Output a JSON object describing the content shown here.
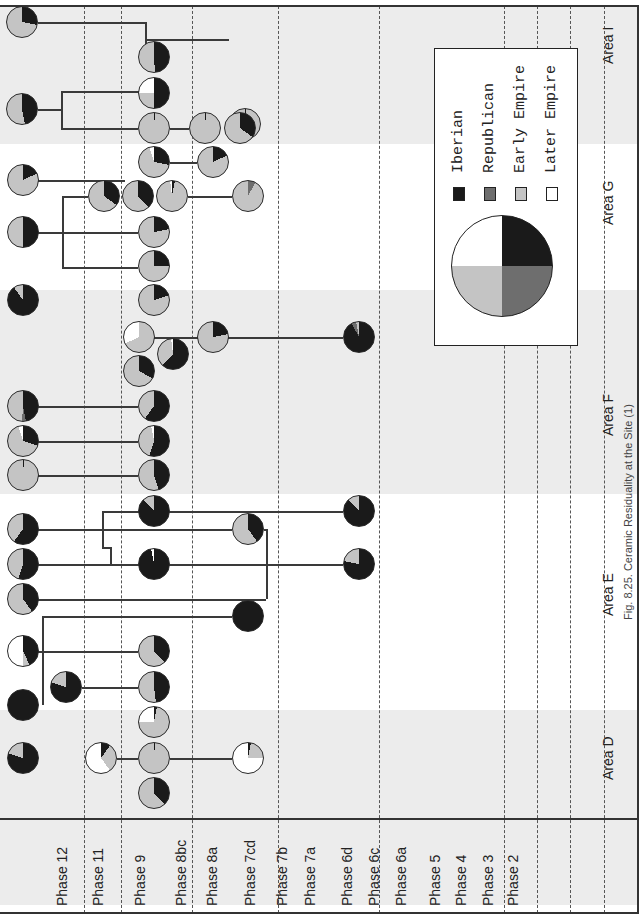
{
  "figure": {
    "caption": "Fig. 8.25. Ceramic Residuality at the Site (1)",
    "orientation": "rotated-90-ccw"
  },
  "colors": {
    "iberian": "#1a1a1a",
    "republican": "#6e6e6e",
    "early_empire": "#c4c4c4",
    "later_empire": "#ffffff",
    "band": "#ececec"
  },
  "legend": {
    "items": [
      {
        "label": "Iberian",
        "color": "#1a1a1a"
      },
      {
        "label": "Republican",
        "color": "#6e6e6e"
      },
      {
        "label": "Early Empire",
        "color": "#c4c4c4"
      },
      {
        "label": "Later Empire",
        "color": "#ffffff"
      }
    ]
  },
  "phases": [
    "Phase 12",
    "Phase 11",
    "Phase 9",
    "Phase 8bc",
    "Phase 8a",
    "Phase 7cd",
    "Phase 7b",
    "Phase 7a",
    "Phase 6d",
    "Phase 6c",
    "Phase 6a",
    "Phase 5",
    "Phase 4",
    "Phase 3",
    "Phase 2"
  ],
  "areas": [
    "Area D",
    "Area E",
    "Area F",
    "Area G",
    "Area I"
  ],
  "chart_data": {
    "type": "pie",
    "title": "Ceramic Residuality at the Site (1)",
    "xlabel": "Phase",
    "ylabel": "Area",
    "legend": [
      "Iberian",
      "Republican",
      "Early Empire",
      "Later Empire"
    ],
    "phase_axis": [
      "Phase 12",
      "Phase 11",
      "Phase 9",
      "Phase 8bc",
      "Phase 8a",
      "Phase 7cd",
      "Phase 7b",
      "Phase 7a",
      "Phase 6d",
      "Phase 6c",
      "Phase 6a",
      "Phase 5",
      "Phase 4",
      "Phase 3",
      "Phase 2"
    ],
    "area_axis": [
      "Area D",
      "Area E",
      "Area F",
      "Area G",
      "Area I"
    ],
    "pies": [
      {
        "area": "Area I",
        "phase": "Phase 12",
        "x": 22,
        "y": 22,
        "r": 16,
        "slices": [
          28,
          0,
          72,
          0
        ]
      },
      {
        "area": "Area I",
        "phase": "Phase 8bc",
        "x": 245,
        "y": 124,
        "r": 16,
        "slices": [
          1,
          0,
          99,
          0
        ]
      },
      {
        "area": "Area I",
        "phase": "Phase 9",
        "x": 154,
        "y": 57,
        "r": 16,
        "slices": [
          49,
          0,
          51,
          0
        ]
      },
      {
        "area": "Area I",
        "phase": "Phase 12",
        "x": 22,
        "y": 109,
        "r": 16,
        "slices": [
          47,
          0,
          53,
          0
        ]
      },
      {
        "area": "Area I",
        "phase": "Phase 9",
        "x": 154,
        "y": 93,
        "r": 16,
        "slices": [
          50,
          0,
          25,
          25
        ]
      },
      {
        "area": "Area I",
        "phase": "Phase 9",
        "x": 154,
        "y": 128,
        "r": 16,
        "slices": [
          1,
          0,
          99,
          0
        ]
      },
      {
        "area": "Area I",
        "phase": "Phase 8bc",
        "x": 205,
        "y": 128,
        "r": 16,
        "slices": [
          1,
          0,
          99,
          0
        ]
      },
      {
        "area": "Area I",
        "phase": "Phase 8bc",
        "x": 240,
        "y": 128,
        "r": 16,
        "slices": [
          35,
          0,
          65,
          0
        ]
      },
      {
        "area": "Area G",
        "phase": "Phase 9",
        "x": 154,
        "y": 162,
        "r": 16,
        "slices": [
          28,
          0,
          67,
          5
        ]
      },
      {
        "area": "Area G",
        "phase": "Phase 8bc",
        "x": 213,
        "y": 162,
        "r": 16,
        "slices": [
          18,
          0,
          82,
          0
        ]
      },
      {
        "area": "Area G",
        "phase": "Phase 12",
        "x": 23,
        "y": 180,
        "r": 16,
        "slices": [
          18,
          0,
          82,
          0
        ]
      },
      {
        "area": "Area G",
        "phase": "Phase 11",
        "x": 104,
        "y": 196,
        "r": 16,
        "slices": [
          35,
          0,
          65,
          0
        ]
      },
      {
        "area": "Area G",
        "phase": "Phase 9",
        "x": 138,
        "y": 196,
        "r": 16,
        "slices": [
          38,
          0,
          62,
          0
        ]
      },
      {
        "area": "Area G",
        "phase": "Phase 9",
        "x": 172,
        "y": 196,
        "r": 16,
        "slices": [
          3,
          0,
          95,
          2
        ]
      },
      {
        "area": "Area G",
        "phase": "Phase 8a",
        "x": 248,
        "y": 196,
        "r": 16,
        "slices": [
          0,
          8,
          92,
          0
        ]
      },
      {
        "area": "Area G",
        "phase": "Phase 12",
        "x": 23,
        "y": 232,
        "r": 16,
        "slices": [
          50,
          0,
          50,
          0
        ]
      },
      {
        "area": "Area G",
        "phase": "Phase 9",
        "x": 154,
        "y": 232,
        "r": 16,
        "slices": [
          22,
          0,
          78,
          0
        ]
      },
      {
        "area": "Area G",
        "phase": "Phase 9",
        "x": 154,
        "y": 266,
        "r": 16,
        "slices": [
          25,
          0,
          75,
          0
        ]
      },
      {
        "area": "Area F",
        "phase": "Phase 12",
        "x": 23,
        "y": 300,
        "r": 16,
        "slices": [
          90,
          0,
          10,
          0
        ]
      },
      {
        "area": "Area F",
        "phase": "Phase 9",
        "x": 154,
        "y": 300,
        "r": 16,
        "slices": [
          20,
          0,
          80,
          0
        ]
      },
      {
        "area": "Area F",
        "phase": "Phase 9",
        "x": 139,
        "y": 337,
        "r": 16,
        "slices": [
          0,
          0,
          68,
          32
        ]
      },
      {
        "area": "Area F",
        "phase": "Phase 8bc",
        "x": 213,
        "y": 337,
        "r": 16,
        "slices": [
          22,
          0,
          78,
          0
        ]
      },
      {
        "area": "Area F",
        "phase": "Phase 7a",
        "x": 359,
        "y": 337,
        "r": 16,
        "slices": [
          92,
          5,
          3,
          0
        ]
      },
      {
        "area": "Area F",
        "phase": "Phase 9",
        "x": 173,
        "y": 354,
        "r": 16,
        "slices": [
          62,
          0,
          36,
          2
        ]
      },
      {
        "area": "Area F",
        "phase": "Phase 9",
        "x": 139,
        "y": 371,
        "r": 16,
        "slices": [
          33,
          0,
          67,
          0
        ]
      },
      {
        "area": "Area F",
        "phase": "Phase 12",
        "x": 23,
        "y": 406,
        "r": 16,
        "slices": [
          47,
          4,
          49,
          0
        ]
      },
      {
        "area": "Area F",
        "phase": "Phase 9",
        "x": 154,
        "y": 406,
        "r": 16,
        "slices": [
          60,
          0,
          40,
          0
        ]
      },
      {
        "area": "Area F",
        "phase": "Phase 12",
        "x": 23,
        "y": 441,
        "r": 16,
        "slices": [
          30,
          0,
          65,
          5
        ]
      },
      {
        "area": "Area F",
        "phase": "Phase 9",
        "x": 154,
        "y": 441,
        "r": 16,
        "slices": [
          55,
          0,
          42,
          3
        ]
      },
      {
        "area": "Area F",
        "phase": "Phase 12",
        "x": 23,
        "y": 475,
        "r": 16,
        "slices": [
          1,
          0,
          99,
          0
        ]
      },
      {
        "area": "Area F",
        "phase": "Phase 9",
        "x": 154,
        "y": 475,
        "r": 16,
        "slices": [
          45,
          0,
          55,
          0
        ]
      },
      {
        "area": "Area E",
        "phase": "Phase 9",
        "x": 154,
        "y": 511,
        "r": 16,
        "slices": [
          88,
          0,
          12,
          0
        ]
      },
      {
        "area": "Area E",
        "phase": "Phase 7a",
        "x": 359,
        "y": 511,
        "r": 16,
        "slices": [
          88,
          0,
          12,
          0
        ]
      },
      {
        "area": "Area E",
        "phase": "Phase 12",
        "x": 23,
        "y": 529,
        "r": 16,
        "slices": [
          60,
          0,
          40,
          0
        ]
      },
      {
        "area": "Area E",
        "phase": "Phase 8a",
        "x": 248,
        "y": 529,
        "r": 16,
        "slices": [
          40,
          0,
          60,
          0
        ]
      },
      {
        "area": "Area E",
        "phase": "Phase 12",
        "x": 23,
        "y": 564,
        "r": 16,
        "slices": [
          55,
          0,
          45,
          0
        ]
      },
      {
        "area": "Area E",
        "phase": "Phase 9",
        "x": 154,
        "y": 564,
        "r": 16,
        "slices": [
          97,
          0,
          0,
          3
        ]
      },
      {
        "area": "Area E",
        "phase": "Phase 7a",
        "x": 359,
        "y": 564,
        "r": 16,
        "slices": [
          78,
          0,
          22,
          0
        ]
      },
      {
        "area": "Area E",
        "phase": "Phase 12",
        "x": 23,
        "y": 599,
        "r": 16,
        "slices": [
          40,
          0,
          60,
          0
        ]
      },
      {
        "area": "Area E",
        "phase": "Phase 7cd",
        "x": 248,
        "y": 616,
        "r": 16,
        "slices": [
          100,
          0,
          0,
          0
        ]
      },
      {
        "area": "Area D",
        "phase": "Phase 12",
        "x": 23,
        "y": 651,
        "r": 16,
        "slices": [
          43,
          0,
          7,
          50
        ]
      },
      {
        "area": "Area D",
        "phase": "Phase 9",
        "x": 154,
        "y": 651,
        "r": 16,
        "slices": [
          38,
          0,
          62,
          0
        ]
      },
      {
        "area": "Area D",
        "phase": "Phase 11",
        "x": 66,
        "y": 687,
        "r": 16,
        "slices": [
          80,
          0,
          20,
          0
        ]
      },
      {
        "area": "Area D",
        "phase": "Phase 9",
        "x": 154,
        "y": 687,
        "r": 16,
        "slices": [
          48,
          0,
          52,
          0
        ]
      },
      {
        "area": "Area D",
        "phase": "Phase 12",
        "x": 23,
        "y": 705,
        "r": 16,
        "slices": [
          100,
          0,
          0,
          0
        ]
      },
      {
        "area": "Area D",
        "phase": "Phase 9",
        "x": 154,
        "y": 722,
        "r": 16,
        "slices": [
          3,
          0,
          72,
          25
        ]
      },
      {
        "area": "Area D",
        "phase": "Phase 12",
        "x": 23,
        "y": 758,
        "r": 16,
        "slices": [
          80,
          0,
          20,
          0
        ]
      },
      {
        "area": "Area D",
        "phase": "Phase 11",
        "x": 101,
        "y": 758,
        "r": 16,
        "slices": [
          10,
          0,
          30,
          60
        ]
      },
      {
        "area": "Area D",
        "phase": "Phase 9",
        "x": 154,
        "y": 758,
        "r": 16,
        "slices": [
          1,
          0,
          99,
          0
        ]
      },
      {
        "area": "Area D",
        "phase": "Phase 8a",
        "x": 248,
        "y": 758,
        "r": 16,
        "slices": [
          3,
          0,
          22,
          75
        ]
      },
      {
        "area": "Area D",
        "phase": "Phase 9",
        "x": 154,
        "y": 793,
        "r": 16,
        "slices": [
          38,
          0,
          62,
          0
        ]
      }
    ],
    "connectors": [
      {
        "x1": 38,
        "y1": 22,
        "x2": 145,
        "y2": 22
      },
      {
        "x1": 145,
        "y1": 22,
        "x2": 145,
        "y2": 57
      },
      {
        "x1": 145,
        "y1": 39,
        "x2": 229,
        "y2": 39
      },
      {
        "x1": 38,
        "y1": 109,
        "x2": 61,
        "y2": 109
      },
      {
        "x1": 61,
        "y1": 91,
        "x2": 61,
        "y2": 128
      },
      {
        "x1": 61,
        "y1": 91,
        "x2": 154,
        "y2": 91
      },
      {
        "x1": 61,
        "y1": 128,
        "x2": 138,
        "y2": 128
      },
      {
        "x1": 170,
        "y1": 128,
        "x2": 189,
        "y2": 128
      },
      {
        "x1": 170,
        "y1": 162,
        "x2": 197,
        "y2": 162
      },
      {
        "x1": 38,
        "y1": 180,
        "x2": 125,
        "y2": 180
      },
      {
        "x1": 188,
        "y1": 196,
        "x2": 232,
        "y2": 196
      },
      {
        "x1": 62,
        "y1": 196,
        "x2": 88,
        "y2": 196
      },
      {
        "x1": 62,
        "y1": 196,
        "x2": 62,
        "y2": 267
      },
      {
        "x1": 38,
        "y1": 232,
        "x2": 138,
        "y2": 232
      },
      {
        "x1": 62,
        "y1": 267,
        "x2": 138,
        "y2": 267
      },
      {
        "x1": 126,
        "y1": 337,
        "x2": 343,
        "y2": 337
      },
      {
        "x1": 38,
        "y1": 406,
        "x2": 138,
        "y2": 406
      },
      {
        "x1": 38,
        "y1": 441,
        "x2": 138,
        "y2": 441
      },
      {
        "x1": 38,
        "y1": 475,
        "x2": 138,
        "y2": 475
      },
      {
        "x1": 102,
        "y1": 511,
        "x2": 343,
        "y2": 511
      },
      {
        "x1": 102,
        "y1": 511,
        "x2": 102,
        "y2": 547
      },
      {
        "x1": 102,
        "y1": 547,
        "x2": 110,
        "y2": 547
      },
      {
        "x1": 110,
        "y1": 547,
        "x2": 110,
        "y2": 564
      },
      {
        "x1": 38,
        "y1": 529,
        "x2": 232,
        "y2": 529
      },
      {
        "x1": 264,
        "y1": 529,
        "x2": 266,
        "y2": 529
      },
      {
        "x1": 266,
        "y1": 529,
        "x2": 266,
        "y2": 599
      },
      {
        "x1": 38,
        "y1": 564,
        "x2": 343,
        "y2": 564
      },
      {
        "x1": 38,
        "y1": 599,
        "x2": 266,
        "y2": 599
      },
      {
        "x1": 42,
        "y1": 616,
        "x2": 232,
        "y2": 616
      },
      {
        "x1": 42,
        "y1": 616,
        "x2": 42,
        "y2": 705
      },
      {
        "x1": 38,
        "y1": 651,
        "x2": 138,
        "y2": 651
      },
      {
        "x1": 82,
        "y1": 687,
        "x2": 138,
        "y2": 687
      },
      {
        "x1": 117,
        "y1": 758,
        "x2": 138,
        "y2": 758
      },
      {
        "x1": 170,
        "y1": 758,
        "x2": 232,
        "y2": 758
      }
    ],
    "bands": [
      {
        "area": "Area I",
        "y0": 0,
        "y1": 144
      },
      {
        "area": "Area F",
        "y0": 284,
        "y1": 494
      },
      {
        "area": "Area D",
        "y0": 704,
        "y1": 905
      }
    ],
    "phase_separators_x": [
      84,
      121,
      192,
      278,
      379,
      504,
      537,
      570,
      604
    ],
    "grid": true,
    "legend_position": "inside-right"
  }
}
